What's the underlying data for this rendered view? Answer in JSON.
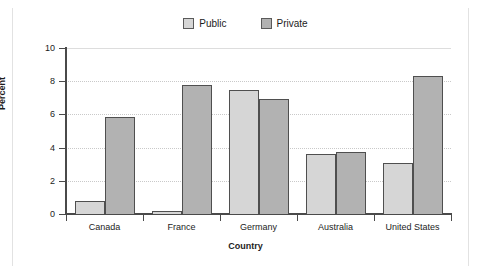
{
  "chart_data": {
    "type": "bar",
    "title": "",
    "subtitle": "",
    "xlabel": "Country",
    "ylabel": "Percent",
    "categories": [
      "Canada",
      "France",
      "Germany",
      "Australia",
      "United States"
    ],
    "series": [
      {
        "name": "Public",
        "color": "#d6d6d6",
        "values": [
          0.8,
          0.2,
          7.5,
          3.6,
          3.1
        ]
      },
      {
        "name": "Private",
        "color": "#b2b2b2",
        "values": [
          5.85,
          7.8,
          6.9,
          3.75,
          8.3
        ]
      }
    ],
    "ylim": [
      0,
      10
    ],
    "yticks": [
      0,
      2,
      4,
      6,
      8,
      10
    ],
    "ytick_labels": [
      "0",
      "2",
      "4",
      "6",
      "8",
      "10"
    ],
    "grid": true,
    "grid_axis": "y",
    "legend_position": "top-center"
  },
  "legend": {
    "items": [
      {
        "label": "Public",
        "swatch": "public-swatch"
      },
      {
        "label": "Private",
        "swatch": "private-swatch"
      }
    ]
  }
}
